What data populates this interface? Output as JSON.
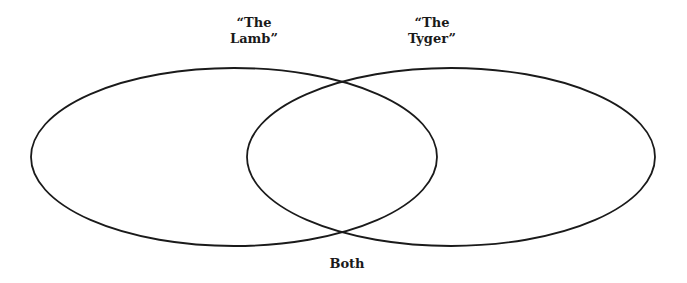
{
  "diagram": {
    "type": "venn",
    "sets": [
      {
        "id": "left",
        "label_line1": "“The",
        "label_line2": "Lamb”",
        "ellipse": {
          "cx": 234,
          "cy": 157,
          "rx": 203,
          "ry": 89
        }
      },
      {
        "id": "right",
        "label_line1": "“The",
        "label_line2": "Tyger”",
        "ellipse": {
          "cx": 451,
          "cy": 157,
          "rx": 204,
          "ry": 89
        }
      }
    ],
    "intersection": {
      "label": "Both"
    },
    "stroke_color": "#1a1a1a",
    "background": "#ffffff"
  }
}
